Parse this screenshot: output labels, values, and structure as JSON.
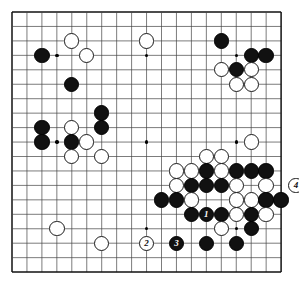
{
  "diagram": {
    "type": "go-board",
    "size": 19,
    "board_color": "#ffffff",
    "line_color": "#444444",
    "border_color": "#111111",
    "black_color": "#111111",
    "white_color": "#ffffff",
    "geometry": {
      "left": 12,
      "top": 12,
      "right": 281,
      "bottom": 272,
      "col_step": 14.95,
      "row_step": 14.45,
      "stone_diameter": 15.4
    },
    "star_points": [
      {
        "col": 4,
        "row": 4
      },
      {
        "col": 10,
        "row": 4
      },
      {
        "col": 16,
        "row": 4
      },
      {
        "col": 4,
        "row": 10
      },
      {
        "col": 10,
        "row": 10
      },
      {
        "col": 16,
        "row": 10
      },
      {
        "col": 4,
        "row": 16
      },
      {
        "col": 10,
        "row": 16
      },
      {
        "col": 16,
        "row": 16
      }
    ],
    "stones": [
      {
        "col": 5,
        "row": 3,
        "color": "white"
      },
      {
        "col": 10,
        "row": 3,
        "color": "white"
      },
      {
        "col": 3,
        "row": 4,
        "color": "black"
      },
      {
        "col": 6,
        "row": 4,
        "color": "white"
      },
      {
        "col": 5,
        "row": 6,
        "color": "black"
      },
      {
        "col": 7,
        "row": 8,
        "color": "black"
      },
      {
        "col": 3,
        "row": 9,
        "color": "black"
      },
      {
        "col": 5,
        "row": 9,
        "color": "white"
      },
      {
        "col": 7,
        "row": 9,
        "color": "black"
      },
      {
        "col": 3,
        "row": 10,
        "color": "black"
      },
      {
        "col": 5,
        "row": 10,
        "color": "black"
      },
      {
        "col": 6,
        "row": 10,
        "color": "white"
      },
      {
        "col": 5,
        "row": 11,
        "color": "white"
      },
      {
        "col": 7,
        "row": 11,
        "color": "white"
      },
      {
        "col": 15,
        "row": 3,
        "color": "black"
      },
      {
        "col": 17,
        "row": 4,
        "color": "black"
      },
      {
        "col": 18,
        "row": 4,
        "color": "black"
      },
      {
        "col": 15,
        "row": 5,
        "color": "white"
      },
      {
        "col": 16,
        "row": 5,
        "color": "black"
      },
      {
        "col": 17,
        "row": 5,
        "color": "white"
      },
      {
        "col": 16,
        "row": 6,
        "color": "white"
      },
      {
        "col": 17,
        "row": 6,
        "color": "white"
      },
      {
        "col": 4,
        "row": 16,
        "color": "white"
      },
      {
        "col": 7,
        "row": 17,
        "color": "white"
      },
      {
        "col": 17,
        "row": 10,
        "color": "white"
      },
      {
        "col": 14,
        "row": 11,
        "color": "white"
      },
      {
        "col": 15,
        "row": 11,
        "color": "white"
      },
      {
        "col": 12,
        "row": 12,
        "color": "white"
      },
      {
        "col": 13,
        "row": 12,
        "color": "white"
      },
      {
        "col": 14,
        "row": 12,
        "color": "black"
      },
      {
        "col": 15,
        "row": 12,
        "color": "white"
      },
      {
        "col": 16,
        "row": 12,
        "color": "black"
      },
      {
        "col": 17,
        "row": 12,
        "color": "black"
      },
      {
        "col": 18,
        "row": 12,
        "color": "black"
      },
      {
        "col": 12,
        "row": 13,
        "color": "white"
      },
      {
        "col": 13,
        "row": 13,
        "color": "black"
      },
      {
        "col": 14,
        "row": 13,
        "color": "black"
      },
      {
        "col": 15,
        "row": 13,
        "color": "black"
      },
      {
        "col": 16,
        "row": 13,
        "color": "white"
      },
      {
        "col": 18,
        "row": 13,
        "color": "white"
      },
      {
        "col": 11,
        "row": 14,
        "color": "black"
      },
      {
        "col": 12,
        "row": 14,
        "color": "black"
      },
      {
        "col": 13,
        "row": 14,
        "color": "white"
      },
      {
        "col": 16,
        "row": 14,
        "color": "white"
      },
      {
        "col": 17,
        "row": 14,
        "color": "white"
      },
      {
        "col": 18,
        "row": 14,
        "color": "black"
      },
      {
        "col": 19,
        "row": 14,
        "color": "black"
      },
      {
        "col": 13,
        "row": 15,
        "color": "black"
      },
      {
        "col": 14,
        "row": 15,
        "color": "black",
        "label": "1"
      },
      {
        "col": 15,
        "row": 15,
        "color": "black"
      },
      {
        "col": 16,
        "row": 15,
        "color": "white"
      },
      {
        "col": 17,
        "row": 15,
        "color": "black"
      },
      {
        "col": 18,
        "row": 15,
        "color": "white"
      },
      {
        "col": 15,
        "row": 16,
        "color": "white"
      },
      {
        "col": 17,
        "row": 16,
        "color": "black"
      },
      {
        "col": 10,
        "row": 17,
        "color": "white",
        "label": "2"
      },
      {
        "col": 12,
        "row": 17,
        "color": "black",
        "label": "3"
      },
      {
        "col": 14,
        "row": 17,
        "color": "black"
      },
      {
        "col": 16,
        "row": 17,
        "color": "black"
      },
      {
        "col": 20,
        "row": 13,
        "color": "white",
        "label": "4"
      }
    ],
    "move_markers": [
      {
        "label": "1",
        "color": "black"
      },
      {
        "label": "2",
        "color": "white"
      },
      {
        "label": "3",
        "color": "black"
      },
      {
        "label": "4",
        "color": "white"
      }
    ]
  }
}
